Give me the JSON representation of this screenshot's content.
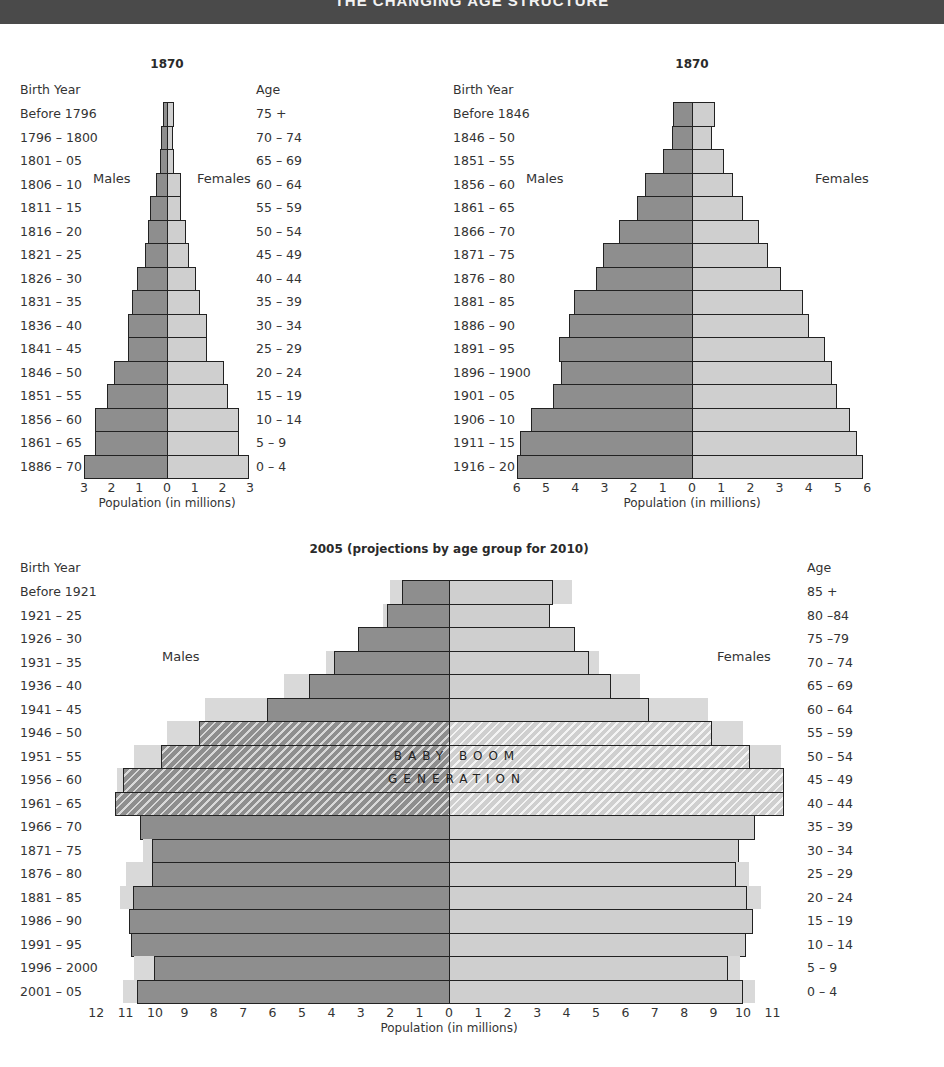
{
  "header": {
    "title": "THE CHANGING AGE STRUCTURE"
  },
  "labels": {
    "birth_year": "Birth Year",
    "age": "Age",
    "males": "Males",
    "females": "Females",
    "xlabel": "Population (in millions)",
    "baby_boom_1": "BABY BOOM",
    "baby_boom_2": "GENERATION"
  },
  "colors": {
    "males": "#8e8e8e",
    "females": "#cfcfcf",
    "projection": "#d9d9d9",
    "header": "#4a4a4a"
  },
  "chart_data": [
    {
      "type": "bar",
      "subtype": "population-pyramid",
      "title": "1870",
      "xlabel": "Population (in millions)",
      "xlim": [
        -3,
        3
      ],
      "xticks": [
        3,
        2,
        1,
        0,
        1,
        2,
        3
      ],
      "categories": [
        "75 +",
        "70 – 74",
        "65 – 69",
        "60 – 64",
        "55 – 59",
        "50 – 54",
        "45 – 49",
        "40 – 44",
        "35 – 39",
        "30 – 34",
        "25 – 29",
        "20 – 24",
        "15 – 19",
        "10 – 14",
        "5 – 9",
        "0 – 4"
      ],
      "birth_years": [
        "Before 1796",
        "1796  – 1800",
        "1801  – 05",
        "1806  – 10",
        "1811  – 15",
        "1816  – 20",
        "1821  – 25",
        "1826  – 30",
        "1831  – 35",
        "1836  – 40",
        "1841  – 45",
        "1846  – 50",
        "1851  – 55",
        "1856  – 60",
        "1861  – 65",
        "1886  – 70"
      ],
      "series": [
        {
          "name": "Males",
          "values": [
            0.15,
            0.2,
            0.25,
            0.4,
            0.6,
            0.7,
            0.8,
            1.1,
            1.25,
            1.4,
            1.4,
            1.9,
            2.15,
            2.6,
            2.6,
            3.0
          ]
        },
        {
          "name": "Females",
          "values": [
            0.25,
            0.2,
            0.25,
            0.5,
            0.5,
            0.7,
            0.8,
            1.05,
            1.2,
            1.45,
            1.45,
            2.05,
            2.2,
            2.6,
            2.6,
            2.95
          ]
        }
      ]
    },
    {
      "type": "bar",
      "subtype": "population-pyramid",
      "title": "1870",
      "xlabel": "Population (in millions)",
      "xlim": [
        -6,
        6
      ],
      "xticks": [
        6,
        5,
        4,
        3,
        2,
        1,
        0,
        1,
        2,
        3,
        4,
        5,
        6
      ],
      "categories": [
        "75 +",
        "70 – 74",
        "65 – 69",
        "60 – 64",
        "55 – 59",
        "50 – 54",
        "45 – 49",
        "40 – 44",
        "35 – 39",
        "30 – 34",
        "25 – 29",
        "20 – 24",
        "15 – 19",
        "10 – 14",
        "5 – 9",
        "0 – 4"
      ],
      "birth_years": [
        "Before 1846",
        "1846  – 50",
        "1851  – 55",
        "1856  – 60",
        "1861  – 65",
        "1866  – 70",
        "1871  – 75",
        "1876  – 80",
        "1881  – 85",
        "1886  – 90",
        "1891  – 95",
        "1896  – 1900",
        "1901  – 05",
        "1906  – 10",
        "1911  – 15",
        "1916  – 20"
      ],
      "series": [
        {
          "name": "Males",
          "values": [
            0.65,
            0.7,
            1.0,
            1.6,
            1.9,
            2.5,
            3.05,
            3.3,
            4.05,
            4.2,
            4.55,
            4.5,
            4.75,
            5.5,
            5.9,
            6.0
          ]
        },
        {
          "name": "Females",
          "values": [
            0.8,
            0.7,
            1.1,
            1.4,
            1.75,
            2.3,
            2.6,
            3.05,
            3.8,
            4.0,
            4.55,
            4.8,
            4.95,
            5.4,
            5.65,
            5.85
          ]
        }
      ]
    },
    {
      "type": "bar",
      "subtype": "population-pyramid",
      "title": "2005 (projections by age group for 2010)",
      "xlabel": "Population (in millions)",
      "xlim": [
        -12,
        11
      ],
      "xticks": [
        12,
        11,
        10,
        9,
        8,
        7,
        6,
        5,
        4,
        3,
        2,
        1,
        0,
        1,
        2,
        3,
        4,
        5,
        6,
        7,
        8,
        9,
        10,
        11
      ],
      "categories": [
        "85 +",
        "80 –84",
        "75 –79",
        "70 – 74",
        "65 – 69",
        "60 – 64",
        "55 – 59",
        "50 – 54",
        "45 – 49",
        "40 – 44",
        "35 – 39",
        "30 – 34",
        "25 – 29",
        "20 – 24",
        "15 – 19",
        "10 – 14",
        "5 – 9",
        "0 – 4"
      ],
      "birth_years": [
        "Before 1921",
        "1921  – 25",
        "1926  – 30",
        "1931  – 35",
        "1936  – 40",
        "1941  – 45",
        "1946  – 50",
        "1951  – 55",
        "1956  – 60",
        "1961  – 65",
        "1966  – 70",
        "1871  – 75",
        "1876  – 80",
        "1881  – 85",
        "1986  – 90",
        "1991  – 95",
        "1996  – 2000",
        "2001  – 05"
      ],
      "annotation": "BABY BOOM GENERATION",
      "baby_boom_rows": [
        6,
        7,
        8,
        9
      ],
      "series": [
        {
          "name": "Males",
          "values": [
            1.6,
            2.1,
            3.1,
            3.9,
            4.75,
            6.2,
            8.5,
            9.8,
            11.1,
            11.35,
            10.5,
            10.1,
            10.1,
            10.75,
            10.9,
            10.8,
            10.05,
            10.6
          ]
        },
        {
          "name": "Females",
          "values": [
            3.55,
            3.45,
            4.3,
            4.75,
            5.5,
            6.8,
            8.95,
            10.25,
            11.4,
            11.4,
            10.4,
            9.85,
            9.75,
            10.15,
            10.35,
            10.1,
            9.5,
            10.0
          ]
        },
        {
          "name": "Males 2010 projection",
          "values": [
            2.0,
            2.25,
            3.1,
            4.2,
            5.6,
            8.3,
            9.6,
            10.7,
            11.3,
            11.35,
            10.5,
            10.4,
            11.0,
            11.2,
            10.9,
            10.8,
            10.7,
            11.1
          ]
        },
        {
          "name": "Females 2010 projection",
          "values": [
            4.2,
            3.45,
            4.3,
            5.1,
            6.5,
            8.8,
            10.0,
            11.3,
            11.4,
            11.4,
            10.4,
            9.85,
            10.2,
            10.6,
            10.35,
            10.1,
            9.9,
            10.4
          ]
        }
      ]
    }
  ]
}
